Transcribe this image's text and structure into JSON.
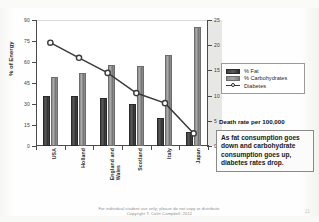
{
  "chart_data": {
    "type": "bar",
    "title": "",
    "subtitle": "",
    "categories": [
      "USA",
      "Holland",
      "England and\nWales",
      "Scotland",
      "Italy",
      "Japan"
    ],
    "series": [
      {
        "name": "% Fat",
        "axis": "left",
        "values": [
          36,
          36,
          34,
          30,
          20,
          10
        ],
        "color": "#3f3f3f"
      },
      {
        "name": "% Carbohydrates",
        "axis": "left",
        "values": [
          49,
          52,
          58,
          57,
          65,
          85
        ],
        "color": "#8d8d8d"
      },
      {
        "name": "Diabetes",
        "axis": "right",
        "type": "line",
        "values": [
          20.5,
          17.5,
          14.5,
          10.5,
          8.5,
          2.5
        ],
        "color": "#3a3a3a"
      }
    ],
    "xlabel": "",
    "ylabel": "% of Energy",
    "ylim": [
      0,
      90
    ],
    "yticks": [
      0,
      15,
      30,
      45,
      60,
      75,
      90
    ],
    "y2label": "Death rate per 100,000",
    "y2lim": [
      0,
      25
    ],
    "y2ticks": [
      0,
      5,
      10,
      15,
      20,
      25
    ],
    "grid": false,
    "legend_position": "right"
  },
  "axes": {
    "left_title": "% of Energy",
    "left_ticks": [
      "90",
      "75",
      "60",
      "45",
      "30",
      "15",
      "0"
    ],
    "right_ticks": [
      "25",
      "20",
      "15",
      "10",
      "5",
      "0"
    ]
  },
  "legend": {
    "items": [
      {
        "label": "% Fat",
        "marker": "fat-swatch"
      },
      {
        "label": "% Carbohydrates",
        "marker": "carb-swatch"
      },
      {
        "label": "Diabetes",
        "marker": "line-marker"
      }
    ]
  },
  "annotations": {
    "death_rate_note": "Death rate per 100,000",
    "callout": "As fat consumption goes down and carbohydrate consumption goes up, diabetes rates drop."
  },
  "footer": {
    "line1": "For individual student use only; please do not copy or distribute.",
    "line2": "Copyright T. Colin Campbell, 2012",
    "page_number": "11"
  }
}
